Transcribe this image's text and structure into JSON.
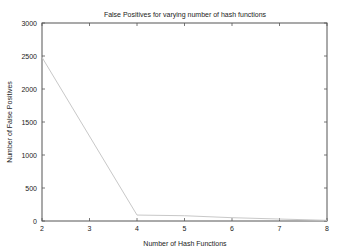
{
  "chart_data": {
    "type": "line",
    "title": "False Positives for varying number of hash functions",
    "xlabel": "Number of Hash Functions",
    "ylabel": "Number of False Positives",
    "x": [
      2,
      4,
      5,
      6,
      7,
      8
    ],
    "series": [
      {
        "name": "False Positives",
        "values": [
          2480,
          90,
          80,
          50,
          30,
          10
        ],
        "color": "#c8c8c8"
      }
    ],
    "xlim": [
      2,
      8
    ],
    "ylim": [
      0,
      3000
    ],
    "xticks": [
      2,
      3,
      4,
      5,
      6,
      7,
      8
    ],
    "yticks": [
      0,
      500,
      1000,
      1500,
      2000,
      2500,
      3000
    ],
    "grid": false,
    "legend": "none",
    "mirrored_ticks": true
  },
  "colors": {
    "frame": "#555555",
    "line": "#c8c8c8",
    "text": "#222222",
    "background": "#ffffff"
  }
}
